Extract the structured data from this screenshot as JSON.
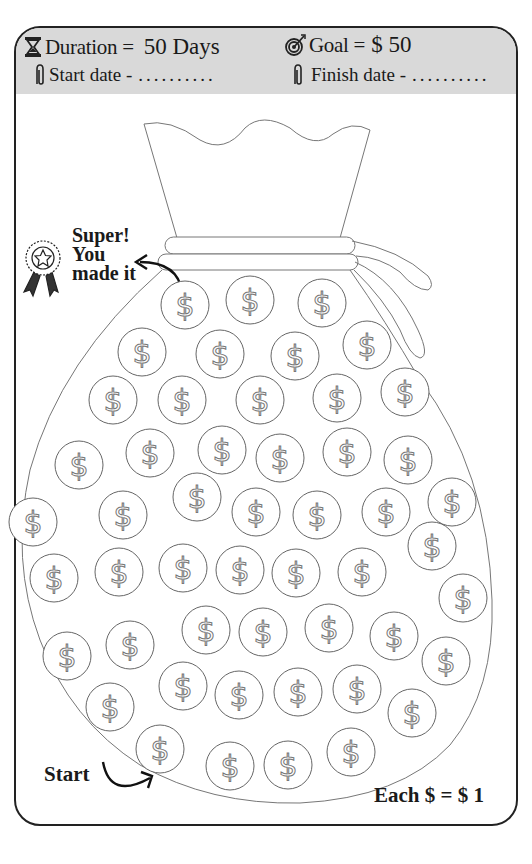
{
  "header": {
    "duration_label": "Duration =",
    "duration_value": "50 Days",
    "goal_label": "Goal =",
    "goal_value": "$ 50",
    "start_date_label": "Start date -",
    "start_date_value": "..........",
    "finish_date_label": "Finish date -",
    "finish_date_value": "..........",
    "icons": {
      "duration": "hourglass-icon",
      "goal": "target-icon",
      "start_date": "paperclip-icon",
      "finish_date": "paperclip-icon"
    }
  },
  "tracker": {
    "finish_message": "Super! You made it",
    "start_label": "Start",
    "legend": "Each $ = $ 1",
    "coin_symbol": "$",
    "coin_count": 50,
    "finish_icon": "award-ribbon-icon"
  },
  "colors": {
    "header_bg": "#d9d9d9",
    "border": "#222222",
    "line": "#777777",
    "text": "#1a1a1a"
  }
}
